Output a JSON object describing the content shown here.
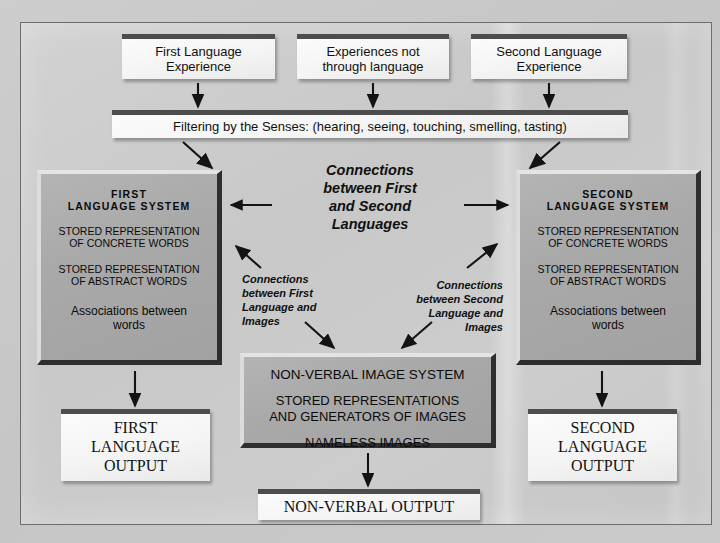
{
  "diagram": {
    "inputs": [
      {
        "id": "first-language-experience",
        "line1": "First Language",
        "line2": "Experience"
      },
      {
        "id": "experiences-not-through-language",
        "line1": "Experiences not",
        "line2": "through language"
      },
      {
        "id": "second-language-experience",
        "line1": "Second Language",
        "line2": "Experience"
      }
    ],
    "filter_bar": "Filtering by the Senses: (hearing, seeing, touching, smelling, tasting)",
    "first_system": {
      "title_line1": "FIRST",
      "title_line2": "LANGUAGE SYSTEM",
      "row1_line1": "STORED REPRESENTATION",
      "row1_line2": "OF CONCRETE WORDS",
      "row2_line1": "STORED REPRESENTATION",
      "row2_line2": "OF ABSTRACT WORDS",
      "row3_line1": "Associations between",
      "row3_line2": "words"
    },
    "second_system": {
      "title_line1": "SECOND",
      "title_line2": "LANGUAGE SYSTEM",
      "row1_line1": "STORED REPRESENTATION",
      "row1_line2": "OF CONCRETE WORDS",
      "row2_line1": "STORED REPRESENTATION",
      "row2_line2": "OF ABSTRACT WORDS",
      "row3_line1": "Associations between",
      "row3_line2": "words"
    },
    "connections_center": {
      "line1": "Connections",
      "line2": "between First",
      "line3": "and Second",
      "line4": "Languages"
    },
    "connections_left": {
      "line1": "Connections",
      "line2": "between First",
      "line3": "Language and",
      "line4": "Images"
    },
    "connections_right": {
      "line1": "Connections",
      "line2": "between Second",
      "line3": "Language and",
      "line4": "Images"
    },
    "image_system": {
      "title": "NON-VERBAL  IMAGE SYSTEM",
      "row1_line1": "STORED REPRESENTATIONS",
      "row1_line2": "AND GENERATORS OF IMAGES",
      "row2": "NAMELESS IMAGES"
    },
    "outputs": {
      "first": {
        "line1": "FIRST",
        "line2": "LANGUAGE",
        "line3": "OUTPUT"
      },
      "second": {
        "line1": "SECOND",
        "line2": "LANGUAGE",
        "line3": "OUTPUT"
      },
      "nonverbal": "NON-VERBAL OUTPUT"
    },
    "caption": "",
    "colors": {
      "page_background": "#c9c9c9",
      "panel_background": "#cbcbcb",
      "light_box": "#f6f6f6",
      "light_box_cap": "#4d4d4d",
      "grey_box": "#a9a9a9",
      "grey_box_shadow": "#2e2e2e",
      "text": "#101010",
      "frame_border": "#6d6d6d"
    }
  }
}
